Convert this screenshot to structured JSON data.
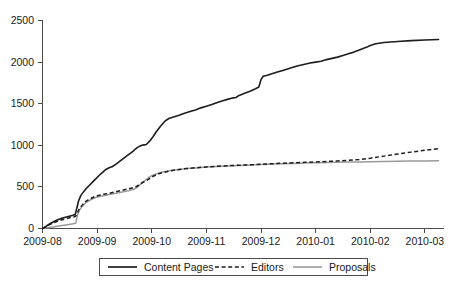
{
  "chart_data": {
    "type": "line",
    "title": "",
    "subtitle": "",
    "xlabel": "",
    "ylabel": "",
    "grid": false,
    "legend_position": "bottom",
    "xlim": [
      0,
      7.35
    ],
    "ylim": [
      0,
      2500
    ],
    "y_ticks": [
      0,
      500,
      1000,
      1500,
      2000,
      2500
    ],
    "y_tick_labels": [
      "0",
      "500",
      "1000",
      "1500",
      "2000",
      "2500"
    ],
    "x_ticks": [
      0,
      1,
      2,
      3,
      4,
      5,
      6,
      7
    ],
    "x_tick_labels": [
      "2009-08",
      "2009-09",
      "2009-10",
      "2009-11",
      "2009-12",
      "2010-01",
      "2010-02",
      "2010-03"
    ],
    "series": [
      {
        "name": "Content Pages",
        "color": "#1c1c1c",
        "style": "solid",
        "x": [
          0.0,
          0.05,
          0.1,
          0.16,
          0.22,
          0.28,
          0.34,
          0.4,
          0.46,
          0.52,
          0.56,
          0.6,
          0.63,
          0.66,
          0.7,
          0.75,
          0.8,
          0.86,
          0.92,
          0.98,
          1.04,
          1.1,
          1.16,
          1.22,
          1.28,
          1.34,
          1.4,
          1.46,
          1.52,
          1.58,
          1.62,
          1.66,
          1.7,
          1.74,
          1.78,
          1.82,
          1.86,
          1.9,
          1.96,
          2.02,
          2.08,
          2.16,
          2.24,
          2.32,
          2.4,
          2.5,
          2.6,
          2.7,
          2.8,
          2.9,
          3.0,
          3.1,
          3.2,
          3.3,
          3.4,
          3.46,
          3.5,
          3.54,
          3.6,
          3.7,
          3.8,
          3.9,
          3.96,
          4.0,
          4.04,
          4.1,
          4.2,
          4.3,
          4.4,
          4.5,
          4.6,
          4.7,
          4.8,
          4.9,
          5.0,
          5.1,
          5.2,
          5.3,
          5.4,
          5.5,
          5.6,
          5.7,
          5.8,
          5.88,
          5.94,
          6.0,
          6.1,
          6.25,
          6.5,
          6.75,
          7.0,
          7.25
        ],
        "y": [
          0,
          20,
          42,
          66,
          88,
          105,
          120,
          132,
          142,
          152,
          160,
          172,
          250,
          330,
          395,
          440,
          480,
          520,
          560,
          600,
          640,
          675,
          710,
          730,
          745,
          770,
          800,
          830,
          860,
          890,
          910,
          930,
          955,
          975,
          990,
          1000,
          1005,
          1010,
          1050,
          1100,
          1160,
          1230,
          1290,
          1325,
          1340,
          1360,
          1385,
          1405,
          1425,
          1450,
          1470,
          1490,
          1515,
          1535,
          1555,
          1565,
          1570,
          1575,
          1600,
          1625,
          1650,
          1680,
          1700,
          1790,
          1830,
          1840,
          1860,
          1880,
          1900,
          1920,
          1940,
          1960,
          1975,
          1990,
          2000,
          2010,
          2030,
          2045,
          2060,
          2080,
          2100,
          2120,
          2145,
          2165,
          2180,
          2200,
          2220,
          2235,
          2248,
          2258,
          2265,
          2272
        ]
      },
      {
        "name": "Editors",
        "color": "#1c1c1c",
        "style": "dashed",
        "x": [
          0.0,
          0.06,
          0.12,
          0.18,
          0.24,
          0.3,
          0.36,
          0.42,
          0.48,
          0.54,
          0.58,
          0.61,
          0.64,
          0.68,
          0.74,
          0.8,
          0.88,
          0.96,
          1.04,
          1.12,
          1.2,
          1.3,
          1.4,
          1.5,
          1.58,
          1.64,
          1.68,
          1.72,
          1.76,
          1.8,
          1.84,
          1.88,
          1.94,
          2.0,
          2.1,
          2.2,
          2.35,
          2.5,
          2.65,
          2.8,
          3.0,
          3.2,
          3.4,
          3.6,
          3.8,
          4.0,
          4.2,
          4.4,
          4.6,
          4.8,
          5.0,
          5.2,
          5.4,
          5.6,
          5.8,
          6.0,
          6.25,
          6.5,
          6.75,
          7.0,
          7.25
        ],
        "y": [
          0,
          22,
          44,
          62,
          78,
          92,
          105,
          115,
          125,
          135,
          142,
          150,
          190,
          245,
          290,
          330,
          360,
          385,
          400,
          412,
          420,
          435,
          450,
          465,
          478,
          488,
          495,
          505,
          520,
          540,
          555,
          565,
          590,
          620,
          650,
          672,
          695,
          710,
          722,
          730,
          740,
          748,
          755,
          760,
          765,
          772,
          778,
          785,
          790,
          795,
          800,
          806,
          812,
          820,
          830,
          845,
          870,
          895,
          918,
          940,
          958
        ]
      },
      {
        "name": "Proposals",
        "color": "#9a9a9a",
        "style": "solid",
        "x": [
          0.0,
          0.08,
          0.16,
          0.24,
          0.32,
          0.4,
          0.48,
          0.54,
          0.58,
          0.61,
          0.64,
          0.68,
          0.74,
          0.8,
          0.88,
          0.96,
          1.04,
          1.12,
          1.2,
          1.3,
          1.4,
          1.5,
          1.58,
          1.64,
          1.68,
          1.72,
          1.76,
          1.8,
          1.84,
          1.88,
          1.94,
          2.0,
          2.1,
          2.2,
          2.35,
          2.5,
          2.65,
          2.8,
          3.0,
          3.2,
          3.4,
          3.6,
          3.8,
          4.0,
          4.2,
          4.4,
          4.6,
          4.8,
          5.0,
          5.2,
          5.4,
          5.6,
          5.8,
          6.0,
          6.25,
          6.5,
          6.75,
          7.0,
          7.25
        ],
        "y": [
          0,
          8,
          16,
          24,
          32,
          40,
          48,
          55,
          60,
          65,
          160,
          225,
          275,
          315,
          345,
          370,
          385,
          395,
          405,
          418,
          430,
          445,
          455,
          465,
          475,
          490,
          510,
          535,
          560,
          580,
          610,
          635,
          660,
          678,
          698,
          710,
          720,
          728,
          738,
          745,
          752,
          758,
          764,
          770,
          774,
          778,
          782,
          786,
          790,
          793,
          796,
          798,
          800,
          802,
          805,
          808,
          810,
          812,
          814
        ]
      }
    ]
  },
  "legend": {
    "entries": [
      {
        "label": "Content Pages",
        "style": "solid-dark"
      },
      {
        "label": "Editors",
        "style": "dashed-dark"
      },
      {
        "label": "Proposals",
        "style": "solid-gray"
      }
    ]
  },
  "axes": {
    "y_tick_labels": [
      "2500",
      "2000",
      "1500",
      "1000",
      "500",
      "0"
    ],
    "x_tick_labels": [
      "2009-08",
      "2009-09",
      "2009-10",
      "2009-11",
      "2009-12",
      "2010-01",
      "2010-02",
      "2010-03"
    ]
  }
}
